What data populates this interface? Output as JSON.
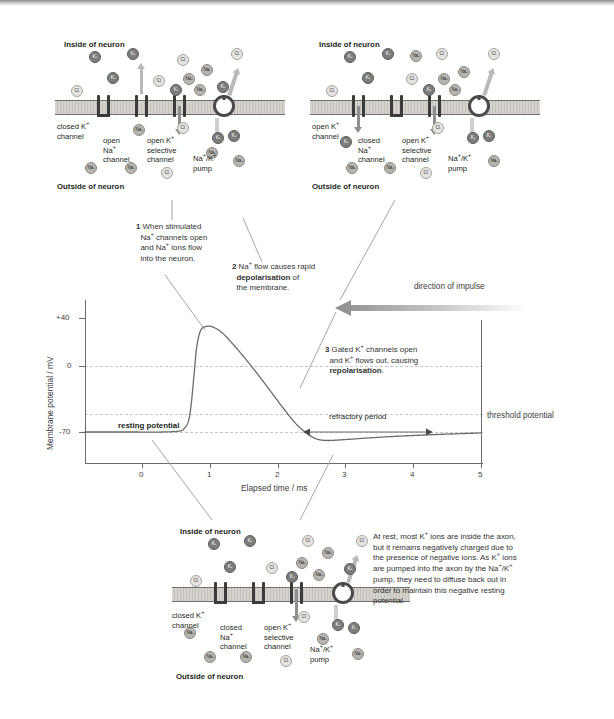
{
  "figure": {
    "ion_labels": {
      "k": "K+",
      "na": "Na+",
      "cl": "Cl-"
    }
  },
  "diagrams": {
    "top_left": {
      "inside": "Inside of neuron",
      "outside": "Outside of neuron",
      "channels": [
        {
          "label": "closed K+ channel",
          "line1": "closed K",
          "line2": "channel",
          "state": "closed"
        },
        {
          "label": "open Na+ channel",
          "line1": "open",
          "line2": "Na",
          "line3": "channel",
          "state": "open"
        },
        {
          "label": "open K+ selective channel",
          "line1": "open K",
          "line2": "selective",
          "line3": "channel",
          "state": "open"
        },
        {
          "label": "Na+/K+ pump",
          "line1": "Na",
          "line2": "pump",
          "state": "pump"
        }
      ]
    },
    "top_right": {
      "inside": "Inside of neuron",
      "outside": "Outside of neuron",
      "channels": [
        {
          "label": "open K+ channel",
          "line1": "open K",
          "line2": "channel",
          "state": "open"
        },
        {
          "label": "closed Na+ channel",
          "line1": "closed",
          "line2": "Na",
          "line3": "channel",
          "state": "closed"
        },
        {
          "label": "open K+ selective channel",
          "line1": "open K",
          "line2": "selective",
          "line3": "channel",
          "state": "open"
        },
        {
          "label": "Na+/K+ pump",
          "line1": "Na",
          "line2": "pump",
          "state": "pump"
        }
      ]
    },
    "bottom": {
      "inside": "Inside of neuron",
      "outside": "Outside of neuron",
      "channels": [
        {
          "label": "closed K+ channel",
          "line1": "closed K",
          "line2": "channel",
          "state": "closed"
        },
        {
          "label": "closed Na+ channel",
          "line1": "closed",
          "line2": "Na",
          "line3": "channel",
          "state": "closed"
        },
        {
          "label": "open K+ selective channel",
          "line1": "open K",
          "line2": "selective",
          "line3": "channel",
          "state": "open"
        },
        {
          "label": "Na+/K+ pump",
          "line1": "Na",
          "line2": "pump",
          "state": "pump"
        }
      ]
    }
  },
  "callouts": {
    "one": {
      "num": "1",
      "text": "When stimulated Na+ channels open and Na+ ions flow into the neuron."
    },
    "two": {
      "num": "2",
      "text_a": "Na+ flow causes rapid ",
      "bold": "depolarisation",
      "text_b": " of the membrane."
    },
    "three": {
      "num": "3",
      "text_a": "Gated K+ channels open and K+ flows out, causing ",
      "bold": "repolarisation",
      "text_b": "."
    }
  },
  "annotations": {
    "direction_of_impulse": "direction of impulse",
    "threshold_potential": "threshold potential",
    "refractory_period": "refractory period",
    "resting_potential": "resting potential"
  },
  "body_text": {
    "paragraph": "At rest, most K+ ions are inside the axon, but it remains negatively charged due to the presence of negative ions. As K+ ions are pumped into the axon by the Na+/K+ pump, they need to diffuse back out in order to maintain this negative resting potential."
  },
  "chart_data": {
    "type": "line",
    "title": "",
    "xlabel": "Elapsed time / ms",
    "ylabel": "Membrane potential / mV",
    "xlim": [
      -0.85,
      5
    ],
    "ylim": [
      -95,
      62
    ],
    "xticks": [
      0,
      1,
      2,
      3,
      4,
      5
    ],
    "xticklabels": [
      "0",
      "1",
      "2",
      "3",
      "4",
      "5"
    ],
    "yticks": [
      40,
      0,
      -70
    ],
    "yticklabels": [
      "+40",
      "0",
      "-70"
    ],
    "gridlines_y": [
      0,
      -55,
      -70
    ],
    "threshold_value": -55,
    "resting_value": -70,
    "peak_value": 42,
    "hyperpolarisation_value": -78,
    "grid": true,
    "legend": "none",
    "series": [
      {
        "name": "membrane potential",
        "x": [
          -0.85,
          -0.2,
          0.3,
          0.55,
          0.62,
          0.68,
          0.72,
          0.76,
          0.8,
          0.86,
          0.95,
          1.05,
          1.18,
          1.35,
          1.55,
          1.8,
          2.05,
          2.25,
          2.4,
          2.5,
          2.6,
          2.75,
          3.0,
          3.4,
          3.9,
          4.4,
          5.0
        ],
        "y": [
          -70,
          -70,
          -70,
          -69,
          -66,
          -58,
          -40,
          -10,
          20,
          38,
          42,
          41,
          35,
          22,
          5,
          -18,
          -42,
          -60,
          -70,
          -75,
          -78,
          -79,
          -78,
          -76,
          -74,
          -72.5,
          -71
        ]
      }
    ]
  }
}
